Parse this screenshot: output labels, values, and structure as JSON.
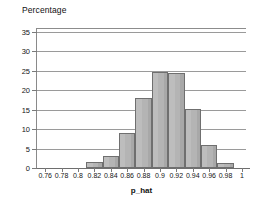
{
  "chart_data": {
    "type": "bar",
    "title": "",
    "ylabel": "Percentage",
    "xlabel": "p_hat",
    "ylim": [
      0,
      36
    ],
    "xlim": [
      0.75,
      1.005
    ],
    "grid": true,
    "legend": "none",
    "y_ticks": [
      0,
      5,
      10,
      15,
      20,
      25,
      30,
      35
    ],
    "y_tick_labels": [
      "0",
      "5",
      "10",
      "15",
      "20",
      "25",
      "30",
      "35"
    ],
    "x_ticks": [
      0.76,
      0.78,
      0.8,
      0.82,
      0.84,
      0.86,
      0.88,
      0.9,
      0.92,
      0.94,
      0.96,
      0.98,
      1
    ],
    "x_tick_labels": [
      "0.76",
      "0.78",
      "0.8",
      "0.82",
      "0.84",
      "0.86",
      "0.88",
      "0.9",
      "0.92",
      "0.94",
      "0.96",
      "0.98",
      "1"
    ],
    "bin_width": 0.02,
    "bin_edges": [
      0.81,
      0.83,
      0.85,
      0.87,
      0.89,
      0.91,
      0.93,
      0.95,
      0.97,
      0.99
    ],
    "categories": [
      "0.81-0.83",
      "0.83-0.85",
      "0.85-0.87",
      "0.87-0.89",
      "0.89-0.91",
      "0.91-0.93",
      "0.93-0.95",
      "0.95-0.97",
      "0.97-0.99"
    ],
    "values": [
      1.5,
      3,
      9,
      18,
      24.7,
      24.5,
      15.3,
      6,
      1.2
    ],
    "bar_color": "#b4b4b4",
    "bar_edge_color": "#6f6f6f",
    "gridline_color": "#9a9a9a",
    "axis_color": "#7a7a7a",
    "background_color": "#ffffff"
  }
}
